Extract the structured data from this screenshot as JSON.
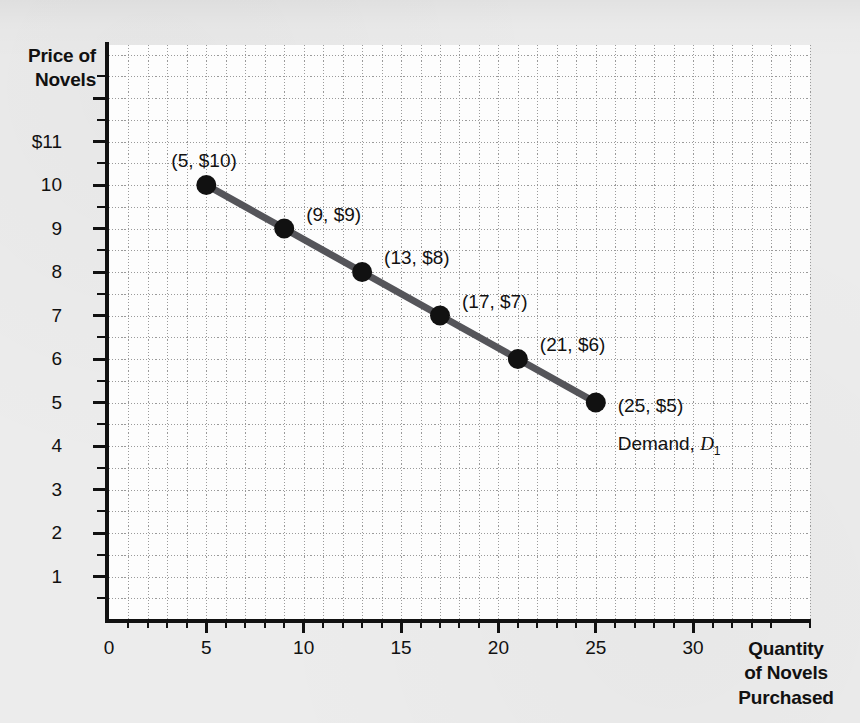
{
  "figure": {
    "background_color": "#ececec",
    "plot_background_color": "#fdfdfd",
    "axis_color": "#111111",
    "grid_color": "#9a9a9a"
  },
  "chart_data": {
    "type": "line",
    "title": "",
    "xlabel": "Quantity of Novels Purchased",
    "ylabel": "Price of Novels",
    "xlabel_lines": [
      "Quantity",
      "of Novels",
      "Purchased"
    ],
    "ylabel_lines": [
      "Price of",
      "Novels"
    ],
    "xlim": [
      0,
      36
    ],
    "ylim": [
      0,
      13.2
    ],
    "grid": true,
    "legend_position": "inline-annotation",
    "line_color": "#55555a",
    "marker_color": "#111111",
    "x_ticks_major": [
      0,
      5,
      10,
      15,
      20,
      25,
      30
    ],
    "x_tick_labels": [
      "0",
      "5",
      "10",
      "15",
      "20",
      "25",
      "30"
    ],
    "x_tick_minor_step": 1,
    "y_ticks_major": [
      1,
      2,
      3,
      4,
      5,
      6,
      7,
      8,
      9,
      10,
      11
    ],
    "y_tick_labels": [
      "1",
      "2",
      "3",
      "4",
      "5",
      "6",
      "7",
      "8",
      "9",
      "10",
      "$11"
    ],
    "y_tick_minor_step": 0.5,
    "x": [
      5,
      9,
      13,
      17,
      21,
      25
    ],
    "values": [
      10,
      9,
      8,
      7,
      6,
      5
    ],
    "series": [
      {
        "name": "Demand, D1",
        "x": [
          5,
          9,
          13,
          17,
          21,
          25
        ],
        "values": [
          10,
          9,
          8,
          7,
          6,
          5
        ]
      }
    ],
    "point_labels": [
      "(5, $10)",
      "(9, $9)",
      "(13, $8)",
      "(17, $7)",
      "(21, $6)",
      "(25, $5)"
    ],
    "annotations": [
      {
        "text": "Demand, D1",
        "text_prefix": "Demand, ",
        "symbol": "D",
        "subscript": "1",
        "x": 25,
        "y": 4.1
      }
    ]
  }
}
